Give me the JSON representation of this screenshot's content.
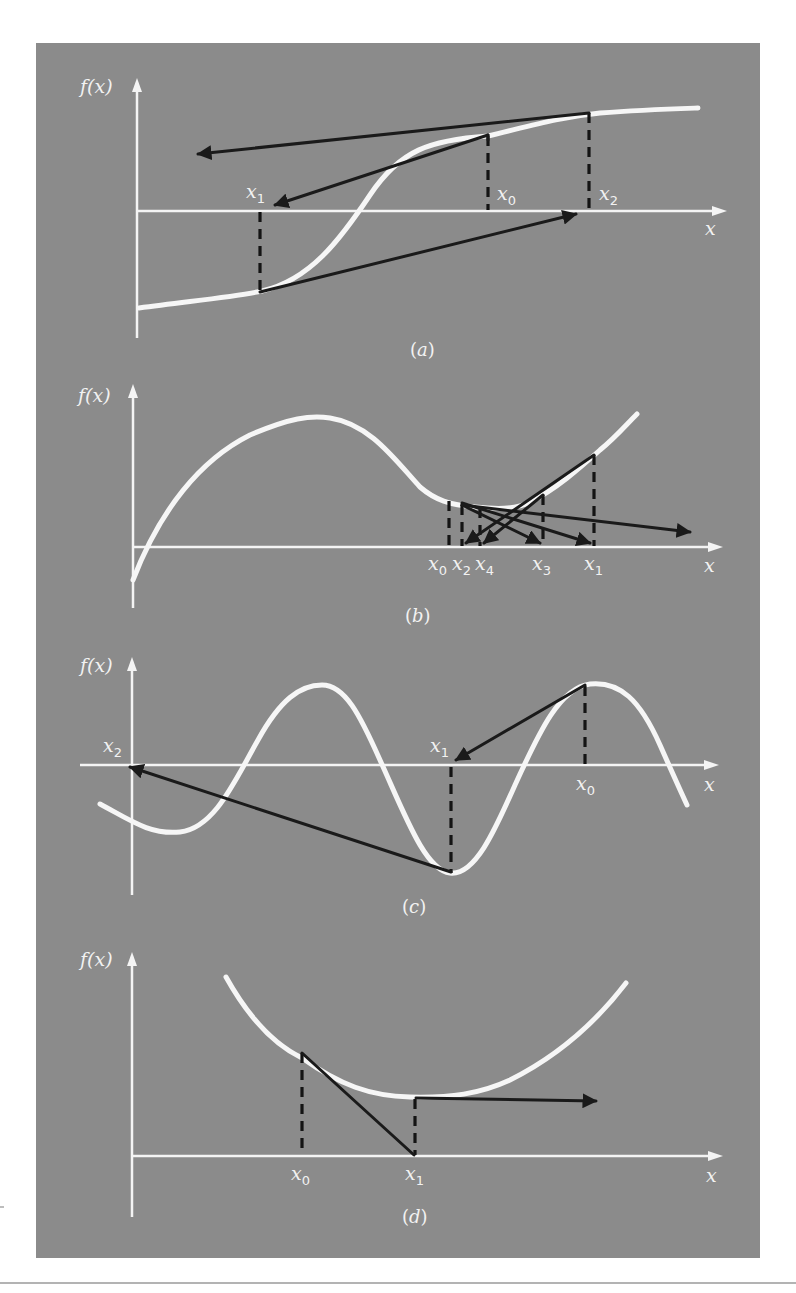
{
  "figure": {
    "background_color": "#8b8b8b",
    "curve_color": "#f6f6f6",
    "tangent_color": "#1a1a1a",
    "panels": [
      {
        "id": "a",
        "caption": "(a)",
        "caption_letter": "a",
        "y_axis_label": "f(x)",
        "x_axis_label": "x",
        "points": [
          {
            "label": "x",
            "sub": "1",
            "note": "dashed line left of inflection"
          },
          {
            "label": "x",
            "sub": "0",
            "note": "initial guess, right of inflection"
          },
          {
            "label": "x",
            "sub": "2",
            "note": "next estimate, further right"
          }
        ],
        "description": "Inflection point near root causes divergence"
      },
      {
        "id": "b",
        "caption": "(b)",
        "caption_letter": "b",
        "y_axis_label": "f(x)",
        "x_axis_label": "x",
        "points": [
          {
            "label": "x",
            "sub": "0"
          },
          {
            "label": "x",
            "sub": "2"
          },
          {
            "label": "x",
            "sub": "4"
          },
          {
            "label": "x",
            "sub": "3"
          },
          {
            "label": "x",
            "sub": "1"
          }
        ],
        "description": "Oscillation around a local minimum"
      },
      {
        "id": "c",
        "caption": "(c)",
        "caption_letter": "c",
        "y_axis_label": "f(x)",
        "x_axis_label": "x",
        "points": [
          {
            "label": "x",
            "sub": "2"
          },
          {
            "label": "x",
            "sub": "1"
          },
          {
            "label": "x",
            "sub": "0"
          }
        ],
        "description": "Initial guess near a local extremum jumps away to distant root"
      },
      {
        "id": "d",
        "caption": "(d)",
        "caption_letter": "d",
        "y_axis_label": "f(x)",
        "x_axis_label": "x",
        "points": [
          {
            "label": "x",
            "sub": "0"
          },
          {
            "label": "x",
            "sub": "1"
          }
        ],
        "description": "Zero slope at x1 sends tangent off horizontally"
      }
    ]
  }
}
